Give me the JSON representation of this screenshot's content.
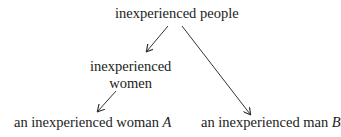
{
  "diagram": {
    "nodes": [
      {
        "id": "root",
        "label": "inexperienced people"
      },
      {
        "id": "women",
        "label_line1": "inexperienced",
        "label_line2": "women"
      },
      {
        "id": "woman_a",
        "label": "an inexperienced woman ",
        "var": "A"
      },
      {
        "id": "man_b",
        "label": "an inexperienced man ",
        "var": "B"
      }
    ],
    "edges": [
      {
        "from": "root",
        "to": "women"
      },
      {
        "from": "women",
        "to": "woman_a"
      },
      {
        "from": "root",
        "to": "man_b"
      }
    ],
    "colors": {
      "text": "#222222",
      "arrow": "#333333",
      "background": "#ffffff"
    }
  }
}
